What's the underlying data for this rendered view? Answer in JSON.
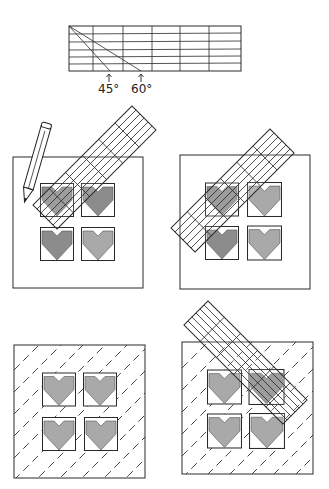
{
  "figure": {
    "ruler_top": {
      "angle_labels": [
        "45°",
        "60°"
      ],
      "columns": 6,
      "rows": 6
    },
    "panels": [
      {
        "id": "panel-1",
        "description": "Ruler placed at 45° across blocks; pencil marking line"
      },
      {
        "id": "panel-2",
        "description": "Ruler moved to next diagonal position"
      },
      {
        "id": "panel-3",
        "description": "Quilt top with dashed diagonal marking lines"
      },
      {
        "id": "panel-4",
        "description": "Ruler placed in opposite direction for cross-hatching"
      }
    ],
    "block_grid": {
      "rows": 2,
      "cols": 2,
      "motif": "heart"
    },
    "colors": {
      "line": "#2a2a2a",
      "heart_fill": "#a9a9a9",
      "background": "#ffffff"
    }
  }
}
